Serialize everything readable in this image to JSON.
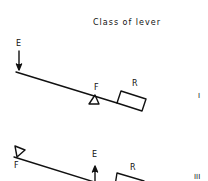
{
  "title": "Class of lever",
  "colors": {
    "ink": "#111111",
    "background": "#ffffff"
  },
  "levers": [
    {
      "class_label": "I",
      "labels": {
        "effort": "E",
        "fulcrum": "F",
        "resistance": "R"
      },
      "effort_arrow_direction": "down",
      "order": [
        "E",
        "F",
        "R"
      ]
    },
    {
      "class_label": "III",
      "labels": {
        "effort": "E",
        "fulcrum": "F",
        "resistance": "R"
      },
      "effort_arrow_direction": "up",
      "order": [
        "F",
        "E",
        "R"
      ]
    }
  ]
}
